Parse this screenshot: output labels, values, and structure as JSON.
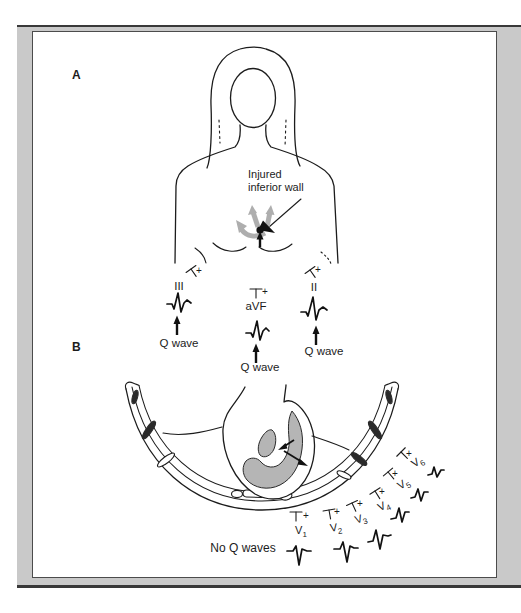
{
  "figure": {
    "section_a_label": "A",
    "section_b_label": "B",
    "injury_label": [
      "Injured",
      "inferior wall"
    ],
    "no_q_waves_label": "No Q waves"
  },
  "limb_leads": [
    {
      "name": "III",
      "electrode_sign": "+",
      "annotation": "Q wave"
    },
    {
      "name": "aVF",
      "electrode_sign": "+",
      "annotation": "Q wave"
    },
    {
      "name": "II",
      "electrode_sign": "+",
      "annotation": "Q wave"
    }
  ],
  "chest_leads": [
    {
      "letter": "V",
      "number": "1",
      "electrode_sign": "+"
    },
    {
      "letter": "V",
      "number": "2",
      "electrode_sign": "+"
    },
    {
      "letter": "V",
      "number": "3",
      "electrode_sign": "+"
    },
    {
      "letter": "V",
      "number": "4",
      "electrode_sign": "+"
    },
    {
      "letter": "V",
      "number": "5",
      "electrode_sign": "+"
    },
    {
      "letter": "V",
      "number": "6",
      "electrode_sign": "+"
    }
  ],
  "colors": {
    "frame_gray": "#c9c9c9",
    "line_black": "#1c1c1c",
    "shade_gray": "#b5b5b5",
    "vector_gray": "#aeaeae"
  }
}
